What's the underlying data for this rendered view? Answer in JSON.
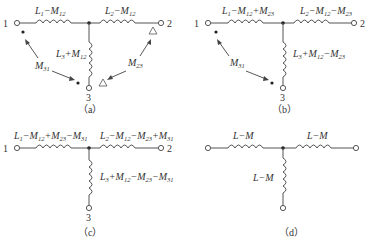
{
  "panels": {
    "a": {
      "caption": "（a）",
      "terminals": {
        "t1": "1",
        "t2": "2",
        "t3": "3"
      },
      "inductors": {
        "left": {
          "L": "L",
          "Lsub": "1",
          "op1": "−",
          "M": "M",
          "Msub": "12"
        },
        "right": {
          "L": "L",
          "Lsub": "2",
          "op1": "−",
          "M": "M",
          "Msub": "12"
        },
        "vert": {
          "L": "L",
          "Lsub": "3",
          "op1": "+",
          "M": "M",
          "Msub": "12"
        }
      },
      "mutuals": {
        "m31": {
          "M": "M",
          "sub": "31"
        },
        "m23": {
          "M": "M",
          "sub": "23"
        }
      }
    },
    "b": {
      "caption": "（b）",
      "terminals": {
        "t1": "1",
        "t2": "2",
        "t3": "3"
      },
      "inductors": {
        "left": {
          "L": "L",
          "Lsub": "1",
          "op1": "−",
          "M1": "M",
          "M1sub": "12",
          "op2": "+",
          "M2": "M",
          "M2sub": "23"
        },
        "right": {
          "L": "L",
          "Lsub": "2",
          "op1": "−",
          "M1": "M",
          "M1sub": "12",
          "op2": "−",
          "M2": "M",
          "M2sub": "23"
        },
        "vert": {
          "L": "L",
          "Lsub": "3",
          "op1": "+",
          "M1": "M",
          "M1sub": "12",
          "op2": "−",
          "M2": "M",
          "M2sub": "23"
        }
      },
      "mutuals": {
        "m31": {
          "M": "M",
          "sub": "31"
        }
      }
    },
    "c": {
      "caption": "（c）",
      "terminals": {
        "t1": "1",
        "t2": "2",
        "t3": "3"
      },
      "inductors": {
        "left": {
          "L": "L",
          "Lsub": "1",
          "op1": "−",
          "M1": "M",
          "M1sub": "12",
          "op2": "+",
          "M2": "M",
          "M2sub": "23",
          "op3": "−",
          "M3": "M",
          "M3sub": "31"
        },
        "right": {
          "L": "L",
          "Lsub": "2",
          "op1": "−",
          "M1": "M",
          "M1sub": "12",
          "op2": "−",
          "M2": "M",
          "M2sub": "23",
          "op3": "+",
          "M3": "M",
          "M3sub": "31"
        },
        "vert": {
          "L": "L",
          "Lsub": "3",
          "op1": "+",
          "M1": "M",
          "M1sub": "12",
          "op2": "−",
          "M2": "M",
          "M2sub": "23",
          "op3": "−",
          "M3": "M",
          "M3sub": "31"
        }
      }
    },
    "d": {
      "caption": "（d）",
      "inductors": {
        "left": {
          "text": "L−M"
        },
        "right": {
          "text": "L−M"
        },
        "vert": {
          "text": "L−M"
        }
      }
    }
  }
}
